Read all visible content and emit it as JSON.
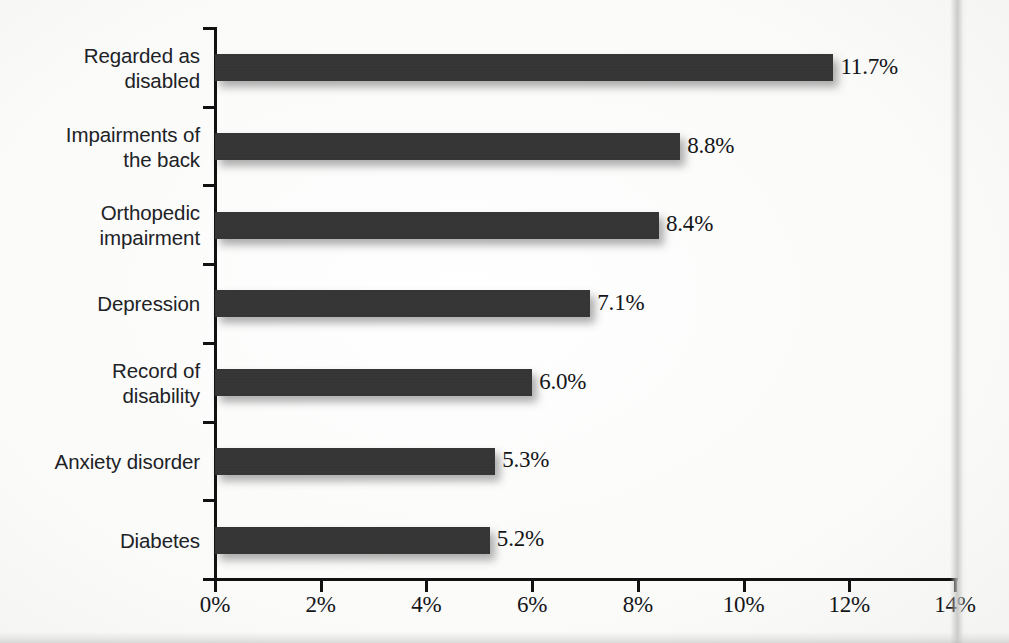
{
  "chart_data": {
    "type": "bar",
    "orientation": "horizontal",
    "title": "",
    "subtitle": "",
    "xlabel": "",
    "ylabel": "",
    "xlim": [
      0,
      14
    ],
    "xtick_labels": [
      "0%",
      "2%",
      "4%",
      "6%",
      "8%",
      "10%",
      "12%",
      "14%"
    ],
    "xticks": [
      0,
      2,
      4,
      6,
      8,
      10,
      12,
      14
    ],
    "grid": false,
    "legend": false,
    "categories": [
      "Regarded as disabled",
      "Impairments of the back",
      "Orthopedic impairment",
      "Depression",
      "Record of disability",
      "Anxiety disorder",
      "Diabetes"
    ],
    "category_lines": [
      [
        "Regarded as",
        "disabled"
      ],
      [
        "Impairments of",
        "the back"
      ],
      [
        "Orthopedic",
        "impairment"
      ],
      [
        "Depression"
      ],
      [
        "Record of",
        "disability"
      ],
      [
        "Anxiety disorder"
      ],
      [
        "Diabetes"
      ]
    ],
    "values": [
      11.7,
      8.8,
      8.4,
      7.1,
      6.0,
      5.3,
      5.2
    ],
    "value_labels": [
      "11.7%",
      "8.8%",
      "8.4%",
      "7.1%",
      "6.0%",
      "5.3%",
      "5.2%"
    ],
    "bar_color": "#343434",
    "text_color": "#202225",
    "background_color": "#fbfbfa"
  }
}
